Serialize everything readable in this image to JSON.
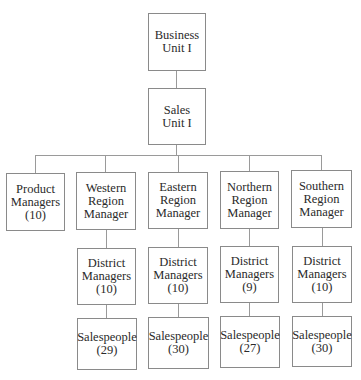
{
  "diagram": {
    "type": "org-chart",
    "root": {
      "label": "Business\nUnit I"
    },
    "level2": {
      "label": "Sales\nUnit I"
    },
    "level3": [
      {
        "label": "Product\nManagers\n(10)"
      },
      {
        "label": "Western\nRegion\nManager"
      },
      {
        "label": "Eastern\nRegion\nManager"
      },
      {
        "label": "Northern\nRegion\nManager"
      },
      {
        "label": "Southern\nRegion\nManager"
      }
    ],
    "district": [
      {
        "region": "Western",
        "label": "District\nManagers\n(10)"
      },
      {
        "region": "Eastern",
        "label": "District\nManagers\n(10)"
      },
      {
        "region": "Northern",
        "label": "District\nManagers\n(9)"
      },
      {
        "region": "Southern",
        "label": "District\nManagers\n(10)"
      }
    ],
    "sales": [
      {
        "region": "Western",
        "label": "Salespeople\n(29)"
      },
      {
        "region": "Eastern",
        "label": "Salespeople\n(30)"
      },
      {
        "region": "Northern",
        "label": "Salespeople\n(27)"
      },
      {
        "region": "Southern",
        "label": "Salespeople\n(30)"
      }
    ]
  }
}
